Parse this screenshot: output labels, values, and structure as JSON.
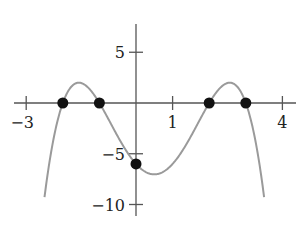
{
  "chart_data": {
    "type": "line",
    "title": "",
    "xlabel": "",
    "ylabel": "",
    "function": "f(x) = -0.5(x+2)(x+1)(x-2)(x-3)",
    "xlim": [
      -3.3,
      4.2
    ],
    "ylim": [
      -10.5,
      8
    ],
    "grid": false,
    "x_ticks": [
      {
        "value": -3,
        "label": "−3"
      },
      {
        "value": 1,
        "label": "1"
      },
      {
        "value": 4,
        "label": "4"
      }
    ],
    "y_ticks": [
      {
        "value": 5,
        "label": "5"
      },
      {
        "value": -5,
        "label": "−5"
      },
      {
        "value": -10,
        "label": "−10"
      }
    ],
    "series": [
      {
        "name": "curve",
        "color": "#9a9a9a",
        "x_range": [
          -2.5,
          3.5
        ]
      }
    ],
    "points": [
      {
        "x": -2,
        "y": 0
      },
      {
        "x": -1,
        "y": 0
      },
      {
        "x": 2,
        "y": 0
      },
      {
        "x": 3,
        "y": 0
      },
      {
        "x": 0,
        "y": -6
      }
    ],
    "colors": {
      "axis": "#555555",
      "curve": "#9a9a9a",
      "point": "#111111"
    }
  }
}
